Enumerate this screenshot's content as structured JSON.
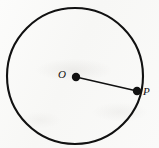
{
  "figure": {
    "type": "geometry-diagram",
    "canvas": {
      "width": 159,
      "height": 148
    },
    "background_color": "#fbfbfa",
    "ink_color": "#111111"
  },
  "circle": {
    "name": "circle",
    "center_x": 75,
    "center_y": 76,
    "radius": 68,
    "stroke_color": "#111111",
    "stroke_width": 2.1,
    "fill": "none"
  },
  "points": [
    {
      "id": "center",
      "label": "O",
      "x": 76,
      "y": 77,
      "dot_radius": 4.2,
      "label_x": 63,
      "label_y": 75,
      "color": "#111111"
    },
    {
      "id": "on-circle",
      "label": "P",
      "x": 137,
      "y": 91,
      "dot_radius": 4.2,
      "label_x": 148,
      "label_y": 92,
      "color": "#111111"
    }
  ],
  "segments": [
    {
      "id": "radius",
      "from": "center",
      "to": "on-circle",
      "x1": 76,
      "y1": 77,
      "x2": 137,
      "y2": 91,
      "stroke_color": "#111111",
      "stroke_width": 1.5
    }
  ],
  "labels": {
    "center_label": "O",
    "point_label": "P"
  }
}
